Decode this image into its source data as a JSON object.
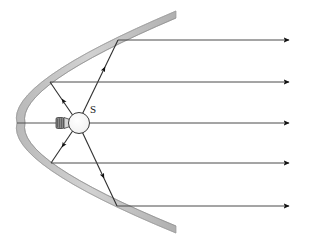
{
  "figure": {
    "background_color": "#ffffff",
    "width": 311,
    "height": 241,
    "labels": [
      {
        "id": "source",
        "text": "S",
        "x": 90,
        "y": 113
      }
    ],
    "colors": {
      "mirror_fill": "#c9c9c9",
      "mirror_edge": "#8a8a8a",
      "ray_stroke": "#3a3a3a",
      "outgoing_ray_stroke": "#555555",
      "bulb_fill": "#f2f2f2",
      "bulb_edge": "#4a4a4a",
      "bulb_base_fill": "#707070",
      "label_color": "#1a1a1a"
    },
    "mirror": {
      "name": "parabolic-mirror",
      "vertex": {
        "x": 17,
        "y": 123
      },
      "top_end": {
        "x": 176,
        "y": 11
      },
      "bottom_end": {
        "x": 176,
        "y": 233
      },
      "thickness": 7,
      "focus": {
        "x": 77,
        "y": 123
      }
    },
    "bulb": {
      "name": "light-bulb-source",
      "center": {
        "x": 78,
        "y": 123
      },
      "radius": 11,
      "base": {
        "x": 56,
        "y": 117,
        "width": 13,
        "height": 13
      }
    },
    "incident_rays": [
      {
        "id": "ray-1",
        "from": {
          "x": 78,
          "y": 123
        },
        "to": {
          "x": 118,
          "y": 40
        },
        "arrow_at": 0.55
      },
      {
        "id": "ray-2",
        "from": {
          "x": 78,
          "y": 123
        },
        "to": {
          "x": 50,
          "y": 82
        },
        "arrow_at": 0.62
      },
      {
        "id": "ray-3",
        "from": {
          "x": 78,
          "y": 123
        },
        "to": {
          "x": 17,
          "y": 123
        },
        "arrow_at": 1.0
      },
      {
        "id": "ray-4",
        "from": {
          "x": 78,
          "y": 123
        },
        "to": {
          "x": 51,
          "y": 163
        },
        "arrow_at": 0.62
      },
      {
        "id": "ray-5",
        "from": {
          "x": 78,
          "y": 123
        },
        "to": {
          "x": 117,
          "y": 206
        },
        "arrow_at": 0.55
      }
    ],
    "reflected_rays": [
      {
        "id": "out-1",
        "from": {
          "x": 118,
          "y": 40
        },
        "to": {
          "x": 291,
          "y": 40
        }
      },
      {
        "id": "out-2",
        "from": {
          "x": 50,
          "y": 82
        },
        "to": {
          "x": 291,
          "y": 82
        }
      },
      {
        "id": "out-3",
        "from": {
          "x": 17,
          "y": 123
        },
        "to": {
          "x": 291,
          "y": 123
        }
      },
      {
        "id": "out-4",
        "from": {
          "x": 51,
          "y": 163
        },
        "to": {
          "x": 291,
          "y": 163
        }
      },
      {
        "id": "out-5",
        "from": {
          "x": 117,
          "y": 206
        },
        "to": {
          "x": 291,
          "y": 206
        }
      }
    ]
  }
}
